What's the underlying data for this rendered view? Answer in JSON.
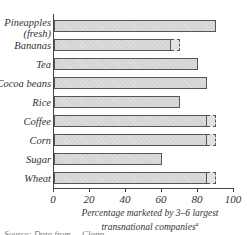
{
  "chart_data": {
    "type": "bar",
    "orientation": "horizontal",
    "title": "",
    "xlabel": "Percentage marketed by 3–6 largest transnational companies",
    "xlabel_lines": [
      "Percentage marketed by 3–6 largest",
      "transnational companies"
    ],
    "xlabel_footnote_marker": "a",
    "ylabel": "",
    "xlim": [
      0,
      100
    ],
    "x_ticks": [
      0,
      20,
      40,
      60,
      80,
      100
    ],
    "grid": false,
    "legend": null,
    "categories": [
      "Pineapples (fresh)",
      "Bananas",
      "Tea",
      "Cocoa beans",
      "Rice",
      "Coffee",
      "Corn",
      "Sugar",
      "Wheat"
    ],
    "category_labels": [
      [
        "Pineapples",
        "(fresh)"
      ],
      [
        "Bananas"
      ],
      [
        "Tea"
      ],
      [
        "Cocoa beans"
      ],
      [
        "Rice"
      ],
      [
        "Coffee"
      ],
      [
        "Corn"
      ],
      [
        "Sugar"
      ],
      [
        "Wheat"
      ]
    ],
    "series": [
      {
        "name": "Minimum share (solid)",
        "values": [
          90,
          65,
          80,
          85,
          70,
          85,
          85,
          60,
          85
        ]
      },
      {
        "name": "Upper range (dashed extension)",
        "values": [
          90,
          70,
          80,
          85,
          70,
          90,
          90,
          60,
          90
        ]
      }
    ]
  },
  "footnote_partial": "Source: Data from ... Clapp ..."
}
